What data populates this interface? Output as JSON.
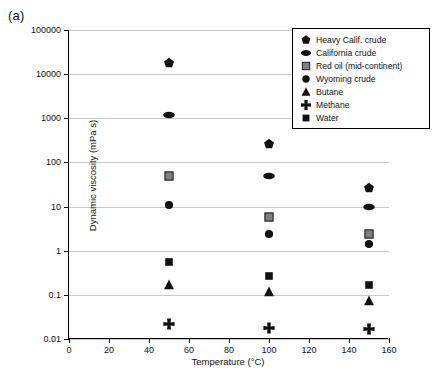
{
  "panel": {
    "label": "(a)"
  },
  "chart_data": {
    "type": "scatter",
    "title": "",
    "xlabel": "Temperature (°C)",
    "ylabel": "Dynamic viscosity (mPa s)",
    "xlim": [
      0,
      160
    ],
    "ylim": [
      0.01,
      100000
    ],
    "yscale": "log",
    "xscale": "linear",
    "grid": "horizontal",
    "legend_position": "top-right",
    "xticks": [
      0,
      20,
      40,
      60,
      80,
      100,
      120,
      140,
      160
    ],
    "xtick_labels": [
      "0",
      "20",
      "40",
      "60",
      "80",
      "100",
      "120",
      "140",
      "160"
    ],
    "yticks": [
      0.01,
      0.1,
      1,
      10,
      100,
      1000,
      10000,
      100000
    ],
    "ytick_labels": [
      "0.01",
      "0.1",
      "1",
      "10",
      "100",
      "1000",
      "10000",
      "100000"
    ],
    "x": [
      50,
      100,
      150
    ],
    "series": [
      {
        "name": "Heavy Calif. crude",
        "marker": "pentagon",
        "color": "#111111",
        "values": [
          18000,
          260,
          26
        ]
      },
      {
        "name": "California crude",
        "marker": "ellipse",
        "color": "#111111",
        "values": [
          1200,
          48,
          9.8
        ]
      },
      {
        "name": "Red oil (mid-continent)",
        "marker": "square-gray",
        "color": "#808080",
        "values": [
          50,
          5.8,
          2.4
        ]
      },
      {
        "name": "Wyoming crude",
        "marker": "circle",
        "color": "#111111",
        "values": [
          11,
          2.4,
          1.4
        ]
      },
      {
        "name": "Butane",
        "marker": "triangle",
        "color": "#111111",
        "values": [
          0.17,
          0.115,
          0.073
        ]
      },
      {
        "name": "Methane",
        "marker": "plus",
        "color": "#111111",
        "values": [
          0.022,
          0.018,
          0.017
        ]
      },
      {
        "name": "Water",
        "marker": "square",
        "color": "#111111",
        "values": [
          0.55,
          0.27,
          0.17
        ]
      }
    ]
  },
  "legend": {
    "items": [
      {
        "label": "Heavy Calif. crude"
      },
      {
        "label": "California crude"
      },
      {
        "label": "Red oil (mid-continent)"
      },
      {
        "label": "Wyoming crude"
      },
      {
        "label": "Butane"
      },
      {
        "label": "Methane"
      },
      {
        "label": "Water"
      }
    ]
  },
  "colors": {
    "axis": "#000000",
    "grid": "#c8c8c8",
    "marker_black": "#111111",
    "marker_gray": "#808080",
    "background": "#ffffff"
  }
}
